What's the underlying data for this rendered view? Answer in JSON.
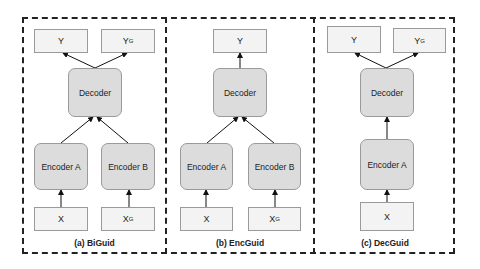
{
  "panels": [
    {
      "id": "a",
      "caption": "(a) BiGuid",
      "outputs": [
        {
          "label": "Y",
          "sup": ""
        },
        {
          "label": "Y",
          "sup": "G"
        }
      ],
      "decoder": "Decoder",
      "encoders": [
        "Encoder A",
        "Encoder B"
      ],
      "inputs": [
        {
          "label": "X",
          "sup": ""
        },
        {
          "label": "X",
          "sup": "G"
        }
      ]
    },
    {
      "id": "b",
      "caption": "(b) EncGuid",
      "outputs": [
        {
          "label": "Y",
          "sup": ""
        }
      ],
      "decoder": "Decoder",
      "encoders": [
        "Encoder A",
        "Encoder B"
      ],
      "inputs": [
        {
          "label": "X",
          "sup": ""
        },
        {
          "label": "X",
          "sup": "G"
        }
      ]
    },
    {
      "id": "c",
      "caption": "(c) DecGuid",
      "outputs": [
        {
          "label": "Y",
          "sup": ""
        },
        {
          "label": "Y",
          "sup": "G"
        }
      ],
      "decoder": "Decoder",
      "encoders": [
        "Encoder A"
      ],
      "inputs": [
        {
          "label": "X",
          "sup": ""
        }
      ]
    }
  ],
  "colors": {
    "border": "#222222",
    "io_fill": "#f3f3f3",
    "block_fill": "#dcdcdc",
    "box_stroke": "#9a9a9a"
  }
}
